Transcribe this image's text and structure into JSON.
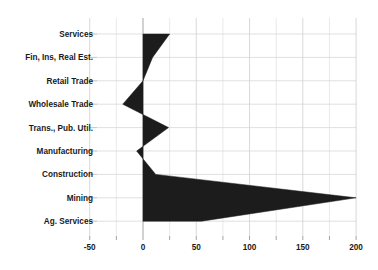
{
  "chart_data": {
    "type": "area",
    "orientation": "horizontal",
    "title": "",
    "subtitle": "",
    "xlabel": "",
    "ylabel": "",
    "categories": [
      "Services",
      "Fin, Ins, Real Est.",
      "Retail Trade",
      "Wholesale Trade",
      "Trans., Pub. Util.",
      "Manufacturing",
      "Construction",
      "Mining",
      "Ag. Services"
    ],
    "values": [
      25,
      9,
      0,
      -19,
      24,
      -6,
      12,
      200,
      55
    ],
    "xticks": [
      -50,
      0,
      50,
      100,
      150,
      200
    ],
    "xtick_labels": [
      "-50",
      "0",
      "50",
      "100",
      "150",
      "200"
    ],
    "xlim": [
      -62,
      207
    ],
    "minor_tick_step": 25,
    "grid": true,
    "grid_axis": "both",
    "legend": "none",
    "series": [
      {
        "name": "",
        "color": "#1c1c1c",
        "values": [
          25,
          9,
          0,
          -19,
          24,
          -6,
          12,
          200,
          55
        ]
      }
    ],
    "colors": {
      "fill": "#1c1c1c",
      "grid_major": "#c8c8c8",
      "grid_minor": "#dcdcdc",
      "axis": "#9a9a9a",
      "text": "#1a1a1a",
      "background": "#ffffff"
    }
  }
}
